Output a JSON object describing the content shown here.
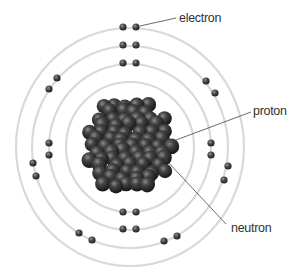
{
  "diagram": {
    "labels": {
      "electron": "electron",
      "proton": "proton",
      "neutron": "neutron"
    },
    "colors": {
      "orbit": "#d9d9d9",
      "particle": "#2b2b2b",
      "text": "#333333",
      "leader_line": "#444444"
    },
    "orbit_count": 4,
    "electron_counts_per_orbit": [
      2,
      4,
      10,
      2
    ]
  }
}
